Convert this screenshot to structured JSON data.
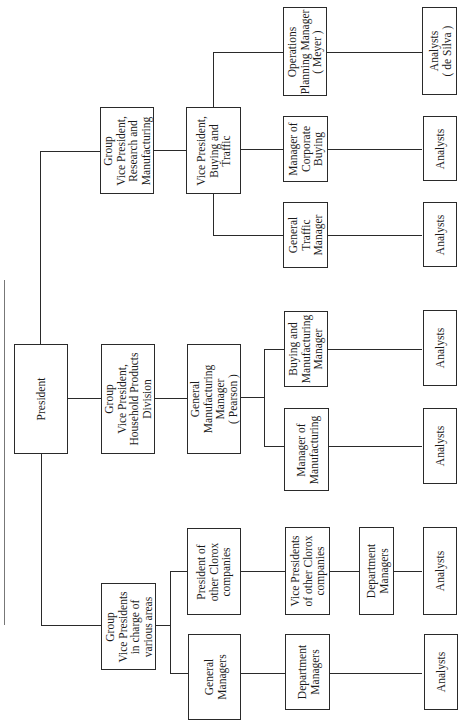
{
  "nodes": {
    "president": "President",
    "gvp_research": "Group\nVice President,\nResearch and\nManufacturing",
    "gvp_household": "Group\nVice President,\nHousehold Products\nDivision",
    "gvp_various": "Group\nVice Presidents\nin charge of\nvarious areas",
    "vp_buying_traffic": "Vice President,\nBuying and\nTraffic",
    "gm_manufacturing": "General\nManufacturing\nManager\n( Pearson )",
    "ops_planning": "Operations\nPlanning Manager\n( Meyer )",
    "corporate_buying": "Manager of\nCorporate\nBuying",
    "general_traffic": "General\nTraffic\nManager",
    "buying_mfg_mgr": "Buying and\nManufacturing\nManager",
    "mgr_manufacturing": "Manager of\nManufacturing",
    "president_other": "President of\nother Clorox\ncompanies",
    "general_managers": "General\nManagers",
    "vp_other": "Vice Presidents\nof other Clorox\ncompanies",
    "dept_mgrs_other": "Department\nManagers",
    "dept_mgrs_gm": "Department\nManagers",
    "analysts_desilva": "Analysts\n( de Silva )",
    "analysts_corporate": "Analysts",
    "analysts_traffic": "Analysts",
    "analysts_buying_mfg": "Analysts",
    "analysts_manufacturing": "Analysts",
    "analysts_other": "Analysts",
    "analysts_gm": "Analysts"
  }
}
